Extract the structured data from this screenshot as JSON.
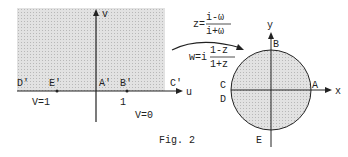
{
  "figure": {
    "caption": "Fig. 2",
    "left_plane": {
      "axis_u": "u",
      "axis_v": "v",
      "points": {
        "D": "D'",
        "E": "E'",
        "A": "A'",
        "B": "B'",
        "C": "C'"
      },
      "tick_one": "1",
      "v_eq_1": "V=1",
      "v_eq_0": "V=0"
    },
    "mapping": {
      "z_lhs": "z=",
      "z_num": "i-ω",
      "z_den": "i+ω",
      "w_lhs": "w=i",
      "w_num": "1-z",
      "w_den": "1+z"
    },
    "disk": {
      "axis_x": "x",
      "axis_y": "y",
      "points": {
        "A": "A",
        "B": "B",
        "C": "C",
        "D": "D",
        "E": "E"
      }
    },
    "colors": {
      "shade": "#d9d9d9",
      "line": "#222222"
    }
  }
}
